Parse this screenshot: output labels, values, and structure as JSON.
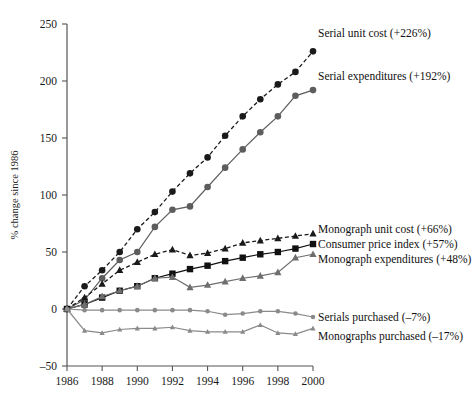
{
  "chart_data": {
    "type": "line",
    "title": "",
    "xlabel": "",
    "ylabel": "% change since 1986",
    "xlim": [
      1986,
      2000
    ],
    "ylim": [
      -50,
      250
    ],
    "ytick_labels": [
      "250",
      "200",
      "150",
      "100",
      "50",
      "0",
      "-50"
    ],
    "ytick_values": [
      250,
      200,
      150,
      100,
      50,
      0,
      -50
    ],
    "xtick_labels": [
      "1986",
      "1988",
      "1990",
      "1992",
      "1994",
      "1996",
      "1998",
      "2000"
    ],
    "xtick_values": [
      1986,
      1988,
      1990,
      1992,
      1994,
      1996,
      1998,
      2000
    ],
    "grid": false,
    "legend_position": "inline-right",
    "x": [
      1986,
      1987,
      1988,
      1989,
      1990,
      1991,
      1992,
      1993,
      1994,
      1995,
      1996,
      1997,
      1998,
      1999,
      2000
    ],
    "series": [
      {
        "name": "Serial unit cost",
        "label": "Serial unit cost (+226%)",
        "delta": "+226%",
        "color": "#1a1a1a",
        "marker": "circle",
        "dash": "dashed",
        "values": [
          0,
          20,
          34,
          50,
          70,
          85,
          103,
          119,
          133,
          152,
          169,
          184,
          197,
          208,
          226
        ]
      },
      {
        "name": "Serial expenditures",
        "label": "Serial expenditures (+192%)",
        "delta": "+192%",
        "color": "#5d5d5d",
        "marker": "circle",
        "dash": "solid",
        "values": [
          0,
          8,
          27,
          43,
          50,
          72,
          87,
          90,
          107,
          124,
          140,
          155,
          169,
          187,
          192
        ]
      },
      {
        "name": "Monograph unit cost",
        "label": "Monograph unit cost (+66%)",
        "delta": "+66%",
        "color": "#1a1a1a",
        "marker": "triangle",
        "dash": "dashed",
        "values": [
          0,
          10,
          22,
          34,
          41,
          48,
          52,
          47,
          49,
          53,
          58,
          60,
          62,
          64,
          66
        ]
      },
      {
        "name": "Consumer price index",
        "label": "Consumer price index (+57%)",
        "delta": "+57%",
        "color": "#111111",
        "marker": "square",
        "dash": "solid",
        "values": [
          0,
          4,
          10,
          16,
          20,
          27,
          31,
          35,
          38,
          42,
          45,
          48,
          50,
          53,
          57
        ]
      },
      {
        "name": "Monograph expenditures",
        "label": "Monograph expenditures (+48%)",
        "delta": "+48%",
        "color": "#6e6e6e",
        "marker": "triangle",
        "dash": "solid",
        "values": [
          0,
          4,
          11,
          16,
          20,
          27,
          28,
          19,
          21,
          24,
          27,
          29,
          32,
          45,
          48
        ]
      },
      {
        "name": "Serials purchased",
        "label": "Serials purchased (-7%)",
        "delta": "-7%",
        "color": "#8a8a8a",
        "marker": "circle",
        "dash": "solid",
        "values": [
          0,
          -1,
          -1,
          -1,
          -1,
          -1,
          -1,
          -1,
          -2,
          -5,
          -4,
          -2,
          -2,
          -4,
          -7
        ]
      },
      {
        "name": "Monographs purchased",
        "label": "Monographs purchased (-17%)",
        "delta": "-17%",
        "color": "#8a8a8a",
        "marker": "triangle",
        "dash": "solid",
        "values": [
          0,
          -19,
          -21,
          -18,
          -17,
          -17,
          -16,
          -19,
          -20,
          -20,
          -20,
          -14,
          -21,
          -22,
          -17
        ]
      }
    ],
    "annotations": [
      {
        "text": "Serial unit cost (+226%)",
        "x": 2000,
        "y": 237
      },
      {
        "text": "Serial expenditures (+192%)",
        "x": 2000,
        "y": 199
      },
      {
        "text": "Monograph unit cost (+66%)",
        "x": 2000,
        "y": 66
      },
      {
        "text": "Consumer price index (+57%)",
        "x": 2000,
        "y": 57
      },
      {
        "text": "Monograph expenditures (+48%)",
        "x": 2000,
        "y": 48
      },
      {
        "text": "Serials purchased (-7%)",
        "x": 2000,
        "y": -7
      },
      {
        "text": "Monographs purchased (-17%)",
        "x": 2000,
        "y": -17
      }
    ]
  }
}
